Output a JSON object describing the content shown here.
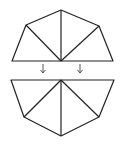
{
  "diagram": {
    "stroke_color": "#222222",
    "top_shape": {
      "outline": [
        [
          12,
          61
        ],
        [
          26,
          25
        ],
        [
          61,
          10
        ],
        [
          99,
          26
        ],
        [
          113,
          61
        ]
      ],
      "hub": [
        61,
        61
      ],
      "spokes": [
        [
          26,
          25
        ],
        [
          61,
          10
        ],
        [
          99,
          26
        ]
      ]
    },
    "arrows": [
      {
        "x": 43,
        "y1": 64,
        "y2": 73
      },
      {
        "x": 80,
        "y1": 64,
        "y2": 73
      }
    ],
    "bottom_shape": {
      "outline": [
        [
          11,
          80
        ],
        [
          24,
          117
        ],
        [
          61,
          136
        ],
        [
          99,
          117
        ],
        [
          114,
          80
        ]
      ],
      "hub": [
        61,
        80
      ],
      "spokes": [
        [
          24,
          117
        ],
        [
          61,
          136
        ],
        [
          99,
          117
        ]
      ]
    }
  }
}
